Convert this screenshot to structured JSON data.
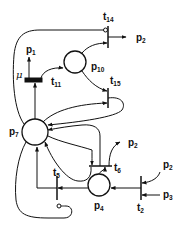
{
  "diagram": {
    "type": "petri-net",
    "places": [
      {
        "id": "p7",
        "label": "p",
        "sub": "7"
      },
      {
        "id": "p10",
        "label": "p",
        "sub": "10"
      },
      {
        "id": "p4",
        "label": "p",
        "sub": "4"
      }
    ],
    "transitions": [
      {
        "id": "t14",
        "label": "t",
        "sub": "14"
      },
      {
        "id": "t11",
        "label": "t",
        "sub": "11"
      },
      {
        "id": "t15",
        "label": "t",
        "sub": "15"
      },
      {
        "id": "t6",
        "label": "t",
        "sub": "6"
      },
      {
        "id": "t5",
        "label": "t",
        "sub": "5"
      },
      {
        "id": "t2",
        "label": "t",
        "sub": "2"
      }
    ],
    "external_labels": [
      {
        "id": "p2_t14",
        "label": "p",
        "sub": "2"
      },
      {
        "id": "p1_t11",
        "label": "p",
        "sub": "1"
      },
      {
        "id": "p2_t6",
        "label": "p",
        "sub": "2"
      },
      {
        "id": "p2_t2",
        "label": "p",
        "sub": "2"
      },
      {
        "id": "p3_t2",
        "label": "p",
        "sub": "3"
      }
    ],
    "rate_label": "μ",
    "colors": {
      "stroke": "#111111",
      "background": "#ffffff"
    }
  }
}
